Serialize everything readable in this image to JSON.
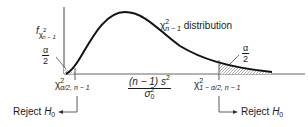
{
  "figure": {
    "y_axis_label": {
      "f": "f",
      "chi": "χ",
      "sup": "2",
      "sub": "n − 1"
    },
    "curve_label": {
      "chi": "χ",
      "sup": "2",
      "sub": "n − 1",
      "text": " distribution"
    },
    "left_tail": {
      "num": "α",
      "den": "2"
    },
    "right_tail": {
      "num": "α",
      "den": "2"
    },
    "left_critical": {
      "chi": "χ",
      "sup": "2",
      "sub": "α/2, n − 1"
    },
    "right_critical": {
      "chi": "χ",
      "sup": "2",
      "sub": "1 − α/2, n − 1"
    },
    "statistic": {
      "num_a": "(n − 1) s",
      "num_sup": "2",
      "den_a": "σ",
      "den_sup": "2",
      "den_sub": "0"
    },
    "reject_left": {
      "text": "Reject ",
      "h": "H",
      "sub": "0"
    },
    "reject_right": {
      "text": "Reject ",
      "h": "H",
      "sub": "0"
    }
  },
  "colors": {
    "ink": "#1a1a1a",
    "axis": "#555555",
    "hatch": "#777777"
  }
}
